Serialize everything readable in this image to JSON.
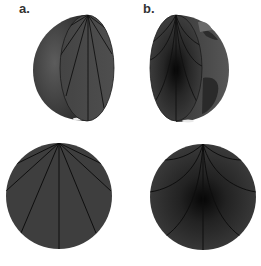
{
  "panels": [
    {
      "id": "a",
      "label": "a.",
      "description": "Cutaway globe showing straight ray paths (chords) radiating from a surface point, with cross-section below"
    },
    {
      "id": "b",
      "label": "b.",
      "description": "Cutaway globe showing curved ray paths radiating from a surface point, with darker dense core, and cross-section below"
    }
  ],
  "colors": {
    "globe_fill": "#4a4a4a",
    "globe_dark": "#2a2a2a",
    "core_dark": "#0d0d0d",
    "ray_line": "#111111",
    "land": "#5a5a5a",
    "background": "#ffffff"
  }
}
